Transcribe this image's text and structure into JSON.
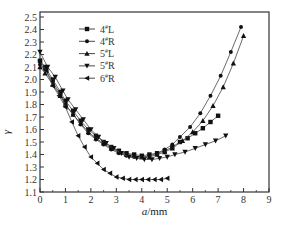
{
  "chart_data": {
    "type": "line",
    "title": "",
    "xlabel": "a/mm",
    "ylabel": "γ",
    "xlim": [
      0,
      9
    ],
    "ylim": [
      1.1,
      2.55
    ],
    "xticks": [
      "0",
      "1",
      "2",
      "3",
      "4",
      "5",
      "6",
      "7",
      "8",
      "9"
    ],
    "yticks": [
      "1.1",
      "1.2",
      "1.3",
      "1.4",
      "1.5",
      "1.6",
      "1.7",
      "1.8",
      "1.9",
      "2.0",
      "2.1",
      "2.2",
      "2.3",
      "2.4",
      "2.5"
    ],
    "grid": false,
    "legend_position": "upper-left",
    "series": [
      {
        "name": "4#L",
        "marker": "square",
        "x": [
          0,
          0.2,
          0.5,
          0.8,
          1.0,
          1.3,
          1.6,
          1.9,
          2.2,
          2.5,
          2.8,
          3.1,
          3.4,
          3.7,
          4.0,
          4.3,
          4.6,
          4.9,
          5.2,
          5.5,
          5.8,
          6.1,
          6.4,
          6.7,
          7.0
        ],
        "y": [
          2.15,
          2.1,
          2.0,
          1.9,
          1.83,
          1.75,
          1.67,
          1.6,
          1.55,
          1.5,
          1.46,
          1.43,
          1.41,
          1.4,
          1.39,
          1.4,
          1.41,
          1.43,
          1.46,
          1.5,
          1.53,
          1.57,
          1.61,
          1.66,
          1.71
        ]
      },
      {
        "name": "4#R",
        "marker": "circle",
        "x": [
          0,
          0.2,
          0.5,
          0.8,
          1.0,
          1.3,
          1.6,
          1.9,
          2.2,
          2.5,
          2.8,
          3.1,
          3.4,
          3.7,
          4.0,
          4.3,
          4.6,
          4.9,
          5.2,
          5.5,
          5.9,
          6.3,
          6.7,
          7.1,
          7.5,
          7.9
        ],
        "y": [
          2.12,
          2.08,
          1.98,
          1.88,
          1.8,
          1.72,
          1.64,
          1.57,
          1.52,
          1.48,
          1.44,
          1.41,
          1.39,
          1.38,
          1.38,
          1.39,
          1.41,
          1.44,
          1.48,
          1.54,
          1.62,
          1.73,
          1.87,
          2.03,
          2.22,
          2.42
        ]
      },
      {
        "name": "5#L",
        "marker": "triangle-up",
        "x": [
          0,
          0.2,
          0.5,
          0.8,
          1.0,
          1.3,
          1.6,
          1.9,
          2.2,
          2.5,
          2.8,
          3.1,
          3.4,
          3.7,
          4.0,
          4.3,
          4.6,
          4.9,
          5.2,
          5.6,
          6.0,
          6.4,
          6.8,
          7.2,
          7.6,
          8.0
        ],
        "y": [
          2.1,
          2.05,
          1.96,
          1.87,
          1.8,
          1.72,
          1.65,
          1.58,
          1.53,
          1.49,
          1.45,
          1.42,
          1.4,
          1.39,
          1.38,
          1.38,
          1.4,
          1.42,
          1.45,
          1.51,
          1.58,
          1.67,
          1.79,
          1.94,
          2.13,
          2.35
        ]
      },
      {
        "name": "5#R",
        "marker": "triangle-down",
        "x": [
          0,
          0.3,
          0.6,
          0.9,
          1.1,
          1.4,
          1.7,
          2.0,
          2.3,
          2.6,
          2.9,
          3.2,
          3.5,
          3.8,
          4.1,
          4.4,
          4.7,
          5.0,
          5.3,
          5.7,
          6.1,
          6.5,
          6.9,
          7.3
        ],
        "y": [
          2.22,
          2.1,
          2.02,
          1.91,
          1.84,
          1.76,
          1.68,
          1.6,
          1.54,
          1.49,
          1.45,
          1.41,
          1.38,
          1.37,
          1.36,
          1.36,
          1.37,
          1.38,
          1.4,
          1.42,
          1.45,
          1.48,
          1.51,
          1.55
        ]
      },
      {
        "name": "6#R",
        "marker": "triangle-left",
        "x": [
          0,
          0.25,
          0.5,
          0.75,
          1.0,
          1.25,
          1.5,
          1.75,
          2.0,
          2.25,
          2.5,
          2.75,
          3.0,
          3.25,
          3.5,
          3.75,
          4.0,
          4.25,
          4.5,
          4.75,
          5.0
        ],
        "y": [
          2.15,
          2.07,
          1.95,
          1.87,
          1.78,
          1.66,
          1.55,
          1.46,
          1.38,
          1.33,
          1.28,
          1.25,
          1.22,
          1.21,
          1.2,
          1.2,
          1.2,
          1.2,
          1.2,
          1.2,
          1.21
        ]
      }
    ]
  }
}
